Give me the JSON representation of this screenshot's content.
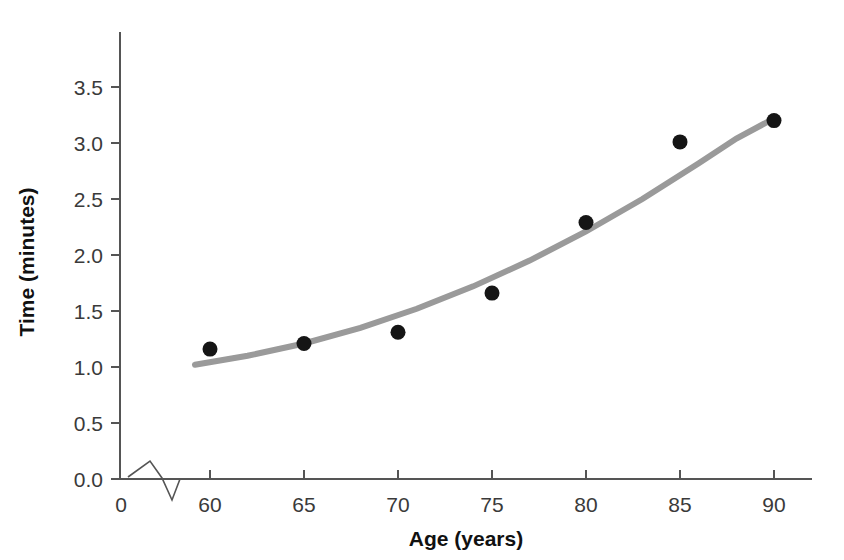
{
  "chart_data": {
    "type": "scatter",
    "title": "",
    "xlabel": "Age (years)",
    "ylabel": "Time (minutes)",
    "xlim": [
      58,
      92
    ],
    "ylim": [
      0.0,
      3.9
    ],
    "x_ticks": [
      "0",
      "60",
      "65",
      "70",
      "75",
      "80",
      "85",
      "90"
    ],
    "x_tick_values": [
      0,
      60,
      65,
      70,
      75,
      80,
      85,
      90
    ],
    "y_ticks": [
      "0.0",
      "0.5",
      "1.0",
      "1.5",
      "2.0",
      "2.5",
      "3.0",
      "3.5"
    ],
    "y_tick_values": [
      0.0,
      0.5,
      1.0,
      1.5,
      2.0,
      2.5,
      3.0,
      3.5
    ],
    "grid": false,
    "legend": "none",
    "axis_break": true,
    "axis_break_note": "zigzag break on x-axis between 0 and 60",
    "x": [
      60,
      65,
      70,
      75,
      80,
      85,
      90
    ],
    "values": [
      1.16,
      1.21,
      1.31,
      1.66,
      2.29,
      3.01,
      3.2
    ],
    "series": [
      {
        "name": "Observed times",
        "marker": "filled-circle",
        "color": "#151515",
        "points": [
          {
            "x": 60,
            "y": 1.16
          },
          {
            "x": 65,
            "y": 1.21
          },
          {
            "x": 70,
            "y": 1.31
          },
          {
            "x": 75,
            "y": 1.66
          },
          {
            "x": 80,
            "y": 2.29
          },
          {
            "x": 85,
            "y": 3.01
          },
          {
            "x": 90,
            "y": 3.2
          }
        ]
      },
      {
        "name": "Fitted curve",
        "type": "line",
        "color": "#9a9a9a",
        "points": [
          {
            "x": 59.2,
            "y": 1.02
          },
          {
            "x": 62,
            "y": 1.1
          },
          {
            "x": 65,
            "y": 1.21
          },
          {
            "x": 68,
            "y": 1.35
          },
          {
            "x": 71,
            "y": 1.52
          },
          {
            "x": 74,
            "y": 1.72
          },
          {
            "x": 77,
            "y": 1.95
          },
          {
            "x": 80,
            "y": 2.21
          },
          {
            "x": 83,
            "y": 2.5
          },
          {
            "x": 86,
            "y": 2.82
          },
          {
            "x": 88,
            "y": 3.04
          },
          {
            "x": 90,
            "y": 3.22
          }
        ]
      }
    ]
  },
  "colors": {
    "background": "#ffffff",
    "axis": "#555555",
    "marker": "#151515",
    "curve": "#9a9a9a",
    "tick_text": "#3a3a3a",
    "title_text": "#111111"
  }
}
